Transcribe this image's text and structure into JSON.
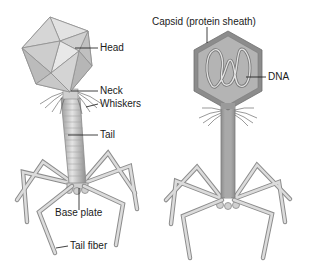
{
  "figure": {
    "left_phage": {
      "name": "external view",
      "labels": {
        "head": "Head",
        "neck": "Neck",
        "whiskers": "Whiskers",
        "tail": "Tail",
        "base_plate": "Base plate",
        "tail_fiber": "Tail fiber"
      }
    },
    "right_phage": {
      "name": "cross-section view",
      "labels": {
        "capsid": "Capsid (protein sheath)",
        "dna": "DNA"
      }
    },
    "colors": {
      "background": "#ffffff",
      "head_light": "#d8d8d8",
      "head_dark": "#a8a8a8",
      "capsid_border": "#8a8a8a",
      "capsid_fill": "#b4b4b4",
      "fiber": "#c8c8c8",
      "fiber_outline": "#8c8c8c",
      "text": "#1a1a1a"
    }
  }
}
